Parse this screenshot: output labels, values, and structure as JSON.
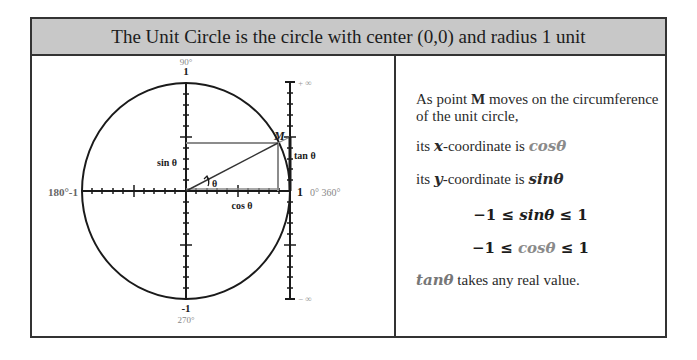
{
  "header": {
    "title": "The Unit Circle is the circle with center (0,0) and radius 1 unit"
  },
  "diagram": {
    "labels": {
      "top_degree": "90°",
      "top_value": "1",
      "left": "180°-1",
      "right_value": "1",
      "right_degree": "0° 360°",
      "bottom_value": "-1",
      "bottom_degree": "270°",
      "point": "M",
      "sin": "sin θ",
      "cos": "cos θ",
      "tan": "tan θ",
      "angle": "θ",
      "plus_infinity": "+ ∞",
      "minus_infinity": "− ∞"
    },
    "colors": {
      "circle": "#1a1a1a",
      "projection_lines": "#8c8c8c",
      "axis": "#1a1a1a",
      "degree_labels": "#888888"
    }
  },
  "text": {
    "line1_pre": "As point ",
    "line1_bold": "M",
    "line1_post": " moves on the circumference of the unit circle,",
    "line2_pre": "its ",
    "line2_var": "x",
    "line2_mid": "-coordinate is ",
    "line2_val": "cosθ",
    "line3_pre": "its ",
    "line3_var": "y",
    "line3_mid": "-coordinate is ",
    "line3_val": "sinθ",
    "ineq_sin_left": "−1 ≤ ",
    "ineq_sin_var": "sinθ",
    "ineq_sin_right": " ≤ 1",
    "ineq_cos_left": "−1 ≤ ",
    "ineq_cos_var": "cosθ",
    "ineq_cos_right": " ≤ 1",
    "tan_var": "tanθ",
    "tan_post": " takes any real value."
  }
}
